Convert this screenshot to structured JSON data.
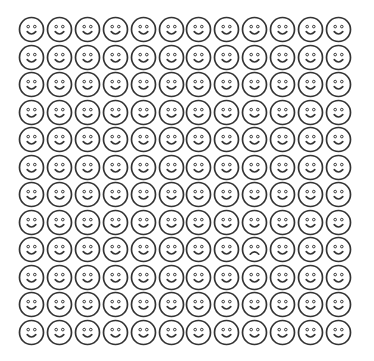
{
  "grid": {
    "rows": 12,
    "columns": 12,
    "default_face": "happy-face-icon",
    "odd_face": {
      "type": "sad-face-icon",
      "row": 8,
      "column": 8
    },
    "stroke_color": "#333333",
    "background_color": "#ffffff"
  }
}
